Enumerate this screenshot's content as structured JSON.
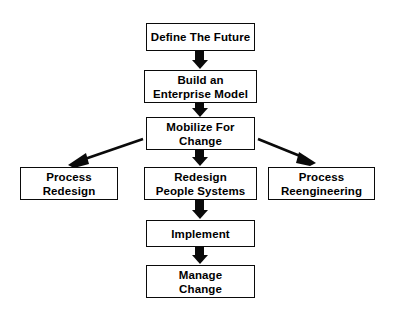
{
  "diagram": {
    "title": "Enterprise Change Process Flowchart",
    "background_color": "#ffffff",
    "line_color": "#0a0a0a",
    "text_color": "#000000",
    "nodes": [
      {
        "id": "define-the-future",
        "label": "Define The Future",
        "shape": "rectangle"
      },
      {
        "id": "build-enterprise-model",
        "label": "Build an\nEnterprise Model",
        "shape": "rectangle"
      },
      {
        "id": "mobilize-for-change",
        "label": "Mobilize For\nChange",
        "shape": "rectangle"
      },
      {
        "id": "process-redesign",
        "label": "Process\nRedesign",
        "shape": "rectangle"
      },
      {
        "id": "redesign-people-systems",
        "label": "Redesign\nPeople Systems",
        "shape": "rectangle"
      },
      {
        "id": "process-reengineering",
        "label": "Process\nReengineering",
        "shape": "rectangle"
      },
      {
        "id": "implement",
        "label": "Implement",
        "shape": "rectangle"
      },
      {
        "id": "manage-change",
        "label": "Manage\nChange",
        "shape": "rectangle"
      }
    ],
    "edges": [
      {
        "from": "define-the-future",
        "to": "build-enterprise-model",
        "style": "block-arrow-down"
      },
      {
        "from": "build-enterprise-model",
        "to": "mobilize-for-change",
        "style": "block-arrow-down"
      },
      {
        "from": "mobilize-for-change",
        "to": "redesign-people-systems",
        "style": "block-arrow-down"
      },
      {
        "from": "mobilize-for-change",
        "to": "process-redesign",
        "style": "line-arrow-diagonal-left"
      },
      {
        "from": "mobilize-for-change",
        "to": "process-reengineering",
        "style": "line-arrow-diagonal-right"
      },
      {
        "from": "redesign-people-systems",
        "to": "implement",
        "style": "block-arrow-down"
      },
      {
        "from": "implement",
        "to": "manage-change",
        "style": "block-arrow-down"
      }
    ]
  }
}
